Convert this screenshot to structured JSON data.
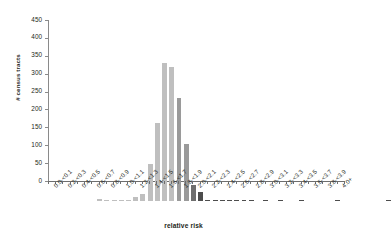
{
  "chart_data": {
    "type": "bar",
    "title": "",
    "xlabel": "relative risk",
    "ylabel": "# census tracts",
    "ylim": [
      0,
      450
    ],
    "yticks": [
      0,
      50,
      100,
      150,
      200,
      250,
      300,
      350,
      400,
      450
    ],
    "grid": false,
    "legend": "none",
    "bar_colors": {
      "light": "#bfbfbf",
      "medium": "#9a9a9a",
      "dark": "#6e6e6e",
      "darkest": "#4d4d4d"
    },
    "categories": [
      "0.0-<0.1",
      "0.1-<0.2",
      "0.2-<0.3",
      "0.3-<0.4",
      "0.4-<0.5",
      "0.5-<0.6",
      "0.6-<0.7",
      "0.7-<0.8",
      "0.8-<0.9",
      "0.9-<1.0",
      "1.0-<1.1",
      "1.1-<1.2",
      "1.2-<1.3",
      "1.3-<1.4",
      "1.4-<1.5",
      "1.5-<1.6",
      "1.6-<1.7",
      "1.7-<1.8",
      "1.8-<1.9",
      "1.9-<2.0",
      "2.0-<2.1",
      "2.1-<2.2",
      "2.2-<2.3",
      "2.3-<2.4",
      "2.4-<2.5",
      "2.5-<2.6",
      "2.6-<2.7",
      "2.7-<2.8",
      "2.8-<2.9",
      "2.9-<3.0",
      "3.0-<3.1",
      "3.1-<3.2",
      "3.2-<3.3",
      "3.3-<3.4",
      "3.4-<3.5",
      "3.5-<3.6",
      "3.6-<3.7",
      "3.7-<3.8",
      "3.8-<3.9",
      "3.9-<4.0",
      "4.0+"
    ],
    "tick_labels_shown": [
      "0.0-<0.1",
      "0.2-<0.3",
      "0.5-<0.6",
      "0.7-<0.8",
      "0.9-<1.0",
      "1.1-<1.2",
      "1.3-<1.4",
      "1.5-<1.6",
      "1.9-<2.0",
      "2.5-<2.6",
      "3.3-<3.4",
      "4.0+"
    ],
    "values": [
      7,
      1,
      3,
      1,
      1,
      10,
      19,
      103,
      218,
      385,
      374,
      287,
      158,
      45,
      25,
      2,
      1,
      1,
      1,
      1,
      1,
      1,
      0,
      1,
      0,
      1,
      0,
      0,
      1,
      0,
      0,
      0,
      0,
      1,
      0,
      0,
      0,
      0,
      0,
      0,
      1
    ],
    "shades": [
      "light",
      "light",
      "light",
      "light",
      "light",
      "light",
      "light",
      "light",
      "light",
      "light",
      "light",
      "medium",
      "medium",
      "dark",
      "darkest",
      "darkest",
      "darkest",
      "darkest",
      "darkest",
      "darkest",
      "darkest",
      "darkest",
      "darkest",
      "darkest",
      "darkest",
      "darkest",
      "darkest",
      "darkest",
      "darkest",
      "darkest",
      "darkest",
      "darkest",
      "darkest",
      "darkest",
      "darkest",
      "darkest",
      "darkest",
      "darkest",
      "darkest",
      "darkest",
      "darkest"
    ]
  }
}
